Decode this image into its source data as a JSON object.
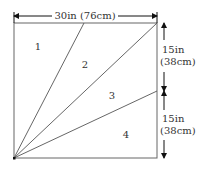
{
  "diagram": {
    "type": "square-divided-by-radial-lines",
    "width_label": "30in (76cm)",
    "height_upper_label": [
      "15in",
      "(38cm)"
    ],
    "height_lower_label": [
      "15in",
      "(38cm)"
    ],
    "regions": [
      "1",
      "2",
      "3",
      "4"
    ],
    "colors": {
      "line": "#555555",
      "arrow": "#111111",
      "background": "#ffffff"
    }
  }
}
